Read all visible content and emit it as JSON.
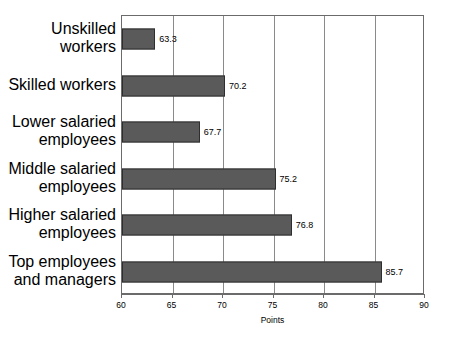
{
  "chart_data": {
    "type": "bar",
    "orientation": "horizontal",
    "title": "",
    "xlabel": "Points",
    "ylabel": "",
    "xlim": [
      60,
      90
    ],
    "xticks": [
      "60",
      "65",
      "70",
      "75",
      "80",
      "85",
      "90"
    ],
    "grid": true,
    "legend": "none",
    "bar_color": "#5a5a5a",
    "bar_border_color": "#2e2e2e",
    "frame_color": "#6b6b6b",
    "gridline_color": "#8a8a8a",
    "categories": [
      "Unskilled workers",
      "Skilled workers",
      "Lower salaried employees",
      "Middle salaried employees",
      "Higher salaried employees",
      "Top employees and managers"
    ],
    "values": [
      63.3,
      70.2,
      67.7,
      75.2,
      76.8,
      85.7
    ],
    "value_labels": [
      "63.3",
      "70.2",
      "67.7",
      "75.2",
      "76.8",
      "85.7"
    ]
  }
}
